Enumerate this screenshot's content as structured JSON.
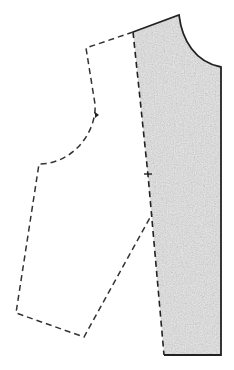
{
  "diagram": {
    "title": "",
    "colors": {
      "background": "#ffffff",
      "outline": "#222222",
      "shading": "#d9d9d9",
      "dashed_line": "#333333"
    },
    "pieces": [
      {
        "name": "shaded-pattern-piece",
        "style": "solid-stippled"
      },
      {
        "name": "dashed-pattern-outline",
        "style": "dashed"
      }
    ],
    "markers": [
      {
        "name": "notch-mark",
        "type": "cross"
      },
      {
        "name": "armhole-notch",
        "type": "triangle"
      }
    ]
  }
}
